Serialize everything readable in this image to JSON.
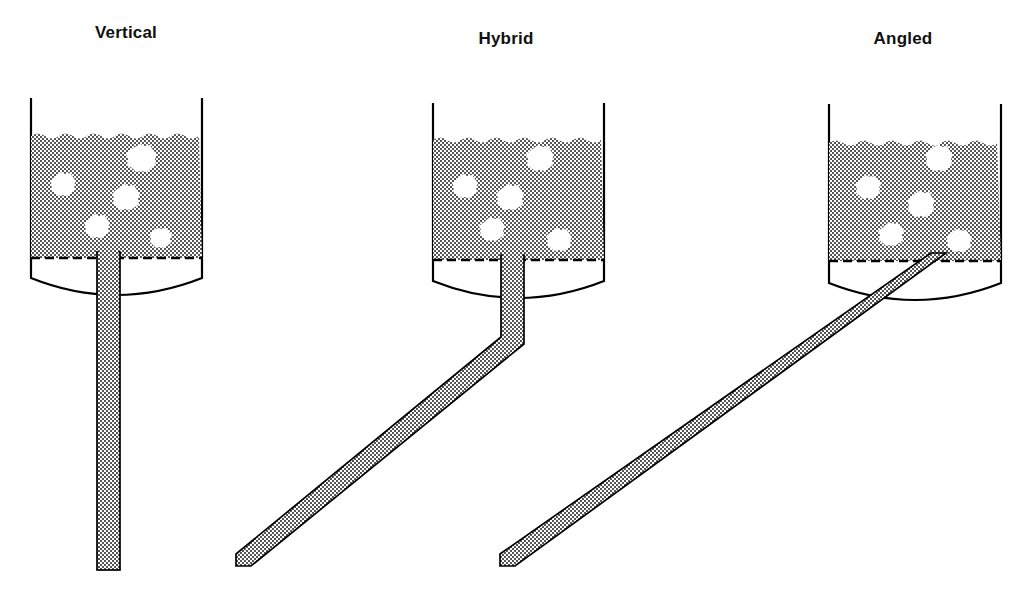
{
  "figure": {
    "title_caption": "",
    "background_color": "#ffffff",
    "line_color": "#000000",
    "slurry_fill_pattern": "checkerboard-hatch",
    "slurry_pattern_color": "#4a4a4a",
    "bubble_color": "#ffffff"
  },
  "panels": [
    {
      "id": "vertical",
      "label": "Vertical",
      "label_x": 126,
      "label_y": 38,
      "vessel": {
        "left_x": 30,
        "right_x": 203,
        "top_y": 98,
        "fill_top_y": 133,
        "fill_bottom_y": 258,
        "wall_bottom_y": 278,
        "bottom_curve_y": 301
      },
      "downcomer": {
        "type": "straight-vertical",
        "left_x": 97,
        "right_x": 120,
        "top_y": 252,
        "bottom_y": 570,
        "bend_y": null,
        "end_x": null
      },
      "bubbles": [
        {
          "cx": 140,
          "cy": 157,
          "r": 13
        },
        {
          "cx": 61,
          "cy": 183,
          "r": 11
        },
        {
          "cx": 124,
          "cy": 196,
          "r": 12
        },
        {
          "cx": 95,
          "cy": 225,
          "r": 11
        },
        {
          "cx": 158,
          "cy": 236,
          "r": 9
        }
      ]
    },
    {
      "id": "hybrid",
      "label": "Hybrid",
      "label_x": 506,
      "label_y": 44,
      "vessel": {
        "left_x": 432,
        "right_x": 605,
        "top_y": 103,
        "fill_top_y": 137,
        "fill_bottom_y": 260,
        "wall_bottom_y": 281,
        "bottom_curve_y": 304
      },
      "downcomer": {
        "type": "bent",
        "left_x": 501,
        "right_x": 524,
        "top_y": 255,
        "bend_y": 344,
        "end_x": 236,
        "bottom_y": 566
      },
      "bubbles": [
        {
          "cx": 538,
          "cy": 157,
          "r": 12
        },
        {
          "cx": 463,
          "cy": 185,
          "r": 11
        },
        {
          "cx": 508,
          "cy": 196,
          "r": 12
        },
        {
          "cx": 490,
          "cy": 228,
          "r": 11
        },
        {
          "cx": 557,
          "cy": 238,
          "r": 10
        }
      ]
    },
    {
      "id": "angled",
      "label": "Angled",
      "label_x": 903,
      "label_y": 44,
      "vessel": {
        "left_x": 828,
        "right_x": 1002,
        "top_y": 104,
        "fill_top_y": 140,
        "fill_bottom_y": 261,
        "wall_bottom_y": 283,
        "bottom_curve_y": 306
      },
      "downcomer": {
        "type": "straight-angled",
        "entry_x": 931,
        "entry_y": 255,
        "end_x": 500,
        "end_y": 566,
        "thickness": 23
      },
      "bubbles": [
        {
          "cx": 937,
          "cy": 157,
          "r": 12
        },
        {
          "cx": 866,
          "cy": 186,
          "r": 11
        },
        {
          "cx": 919,
          "cy": 203,
          "r": 12
        },
        {
          "cx": 889,
          "cy": 233,
          "r": 11
        },
        {
          "cx": 957,
          "cy": 239,
          "r": 10
        }
      ]
    }
  ]
}
